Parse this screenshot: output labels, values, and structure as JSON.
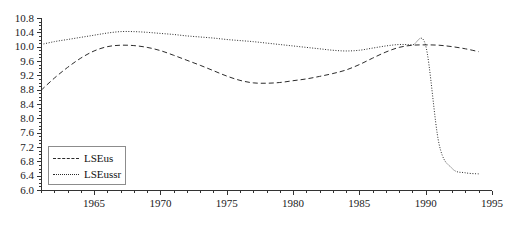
{
  "chart_data": {
    "type": "line",
    "title": "",
    "subtitle": "",
    "xlabel": "",
    "ylabel": "",
    "xlim": [
      1961,
      1995
    ],
    "ylim": [
      6.0,
      10.8
    ],
    "grid": false,
    "legend_position": "lower-left",
    "x_ticks": [
      "1965",
      "1970",
      "1975",
      "1980",
      "1985",
      "1990",
      "1995"
    ],
    "x_tick_values": [
      1965,
      1970,
      1975,
      1980,
      1985,
      1990,
      1995
    ],
    "x_minor_tick_step": 1,
    "y_ticks": [
      "10.8",
      "10.4",
      "10.0",
      "9.6",
      "9.2",
      "8.8",
      "8.4",
      "8.0",
      "7.6",
      "7.2",
      "6.8",
      "6.4",
      "6.0"
    ],
    "y_tick_values": [
      10.8,
      10.4,
      10.0,
      9.6,
      9.2,
      8.8,
      8.4,
      8.0,
      7.6,
      7.2,
      6.8,
      6.4,
      6.0
    ],
    "y_minor_tick_step": 0.1,
    "x": [
      1961,
      1962,
      1963,
      1964,
      1965,
      1966,
      1967,
      1968,
      1969,
      1970,
      1971,
      1972,
      1973,
      1974,
      1975,
      1976,
      1977,
      1978,
      1979,
      1980,
      1981,
      1982,
      1983,
      1984,
      1985,
      1986,
      1987,
      1988,
      1989,
      1990,
      1991,
      1992,
      1993,
      1994
    ],
    "series": [
      {
        "name": "LSEus",
        "style": "dashed",
        "color": "#2b2b2b",
        "values": [
          8.78,
          9.12,
          9.42,
          9.68,
          9.88,
          10.0,
          10.04,
          10.03,
          9.98,
          9.89,
          9.76,
          9.62,
          9.48,
          9.33,
          9.18,
          9.06,
          8.99,
          8.98,
          9.0,
          9.05,
          9.1,
          9.17,
          9.25,
          9.35,
          9.5,
          9.68,
          9.85,
          9.98,
          10.04,
          10.05,
          10.04,
          10.0,
          9.94,
          9.86
        ]
      },
      {
        "name": "LSEussr",
        "style": "dotted",
        "color": "#2b2b2b",
        "values": [
          10.06,
          10.14,
          10.2,
          10.26,
          10.32,
          10.38,
          10.42,
          10.42,
          10.4,
          10.37,
          10.34,
          10.3,
          10.27,
          10.24,
          10.2,
          10.17,
          10.14,
          10.1,
          10.06,
          10.02,
          9.98,
          9.94,
          9.9,
          9.88,
          9.9,
          9.96,
          10.02,
          10.06,
          10.05,
          10.03,
          7.3,
          6.6,
          6.48,
          6.45
        ]
      }
    ],
    "annotations": []
  },
  "legend": {
    "entries": [
      {
        "label": "LSEus"
      },
      {
        "label": "LSEussr"
      }
    ]
  }
}
